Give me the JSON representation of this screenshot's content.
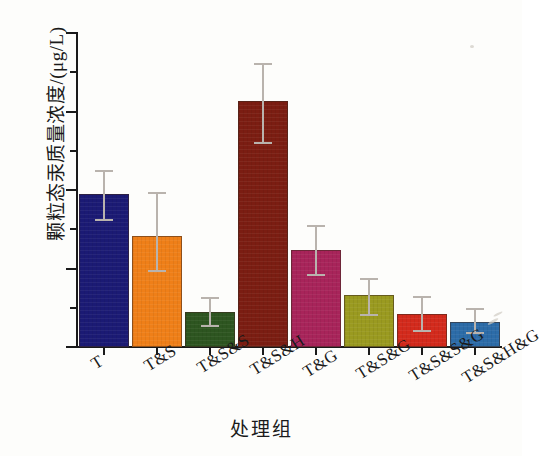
{
  "chart_data": {
    "type": "bar",
    "title": "",
    "xlabel": "处理组",
    "ylabel": "颗粒态汞质量浓度/(μg/L)",
    "categories": [
      "T",
      "T&S",
      "T&S&S",
      "T&S&H",
      "T&G",
      "T&S&G",
      "T&S&S&G",
      "T&S&H&G"
    ],
    "values": [
      1.95,
      1.42,
      0.44,
      3.14,
      1.24,
      0.66,
      0.42,
      0.32
    ],
    "error_upper": [
      2.25,
      1.97,
      0.64,
      3.62,
      1.55,
      0.88,
      0.65,
      0.5
    ],
    "error_lower": [
      1.6,
      0.96,
      0.25,
      2.58,
      0.91,
      0.4,
      0.19,
      0.16
    ],
    "bar_colors": [
      "#1b1a74",
      "#ef7f18",
      "#2d5520",
      "#7b1d12",
      "#a8245a",
      "#9a9a20",
      "#d32a1c",
      "#2c6ca8"
    ],
    "ylim": [
      0,
      4
    ],
    "ytick_labels": [
      "0",
      "1",
      "2",
      "3",
      "4"
    ],
    "ytick_values": [
      0,
      1,
      2,
      3,
      4
    ],
    "yminor_values": [
      0.5,
      1.5,
      2.5,
      3.5
    ],
    "grid": false,
    "legend": "none",
    "errorbar_color": "#b9b3ad"
  },
  "axis": {
    "y_axis_name": "y-axis",
    "x_axis_name": "x-axis"
  }
}
